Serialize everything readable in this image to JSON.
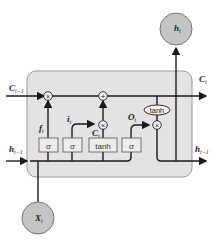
{
  "diagram": {
    "colors": {
      "cell_fill": "#e3e3e3",
      "cell_stroke": "#9a9a9a",
      "line": "#1a1a1a",
      "node_fill": "#c4c4c4",
      "gate_fill": "#ececec"
    },
    "labels": {
      "c_prev": "C",
      "c_prev_sub": "t−1",
      "c_out": "C",
      "c_out_sub": "t",
      "h_prev": "h",
      "h_prev_sub": "t−1",
      "h_out_right": "h",
      "h_out_right_sub": "t−1",
      "h_t": "h",
      "h_t_sub": "t",
      "x_t": "X",
      "x_t_sub": "t",
      "f": "f",
      "f_sub": "t",
      "i": "i",
      "i_sub": "t",
      "c_tilde": "C",
      "c_tilde_sub": "t",
      "o": "O",
      "o_sub": "t"
    },
    "gates": [
      {
        "label": "σ",
        "role": "forget"
      },
      {
        "label": "σ",
        "role": "input"
      },
      {
        "label": "tanh",
        "role": "candidate"
      },
      {
        "label": "σ",
        "role": "output"
      }
    ],
    "operators": {
      "forget_mul": "×",
      "add": "+",
      "input_mul": "×",
      "output_mul": "×",
      "output_tanh": "tanh"
    }
  }
}
